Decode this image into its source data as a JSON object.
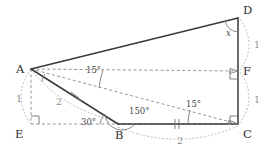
{
  "figure": {
    "background_color": "#ffffff",
    "solid_stroke_color": "#3a3a3a",
    "dashed_stroke_color": "#8a8a8a",
    "arc_stroke_color": "#a8a8a8"
  },
  "vertices": [
    {
      "id": "A",
      "label": "A",
      "x": 31,
      "y": 69,
      "label_x": 16,
      "label_y": 73
    },
    {
      "id": "B",
      "label": "B",
      "x": 118,
      "y": 124,
      "label_x": 115,
      "label_y": 139
    },
    {
      "id": "C",
      "label": "C",
      "x": 238,
      "y": 124,
      "label_x": 243,
      "label_y": 138
    },
    {
      "id": "D",
      "label": "D",
      "x": 238,
      "y": 18,
      "label_x": 243,
      "label_y": 14
    },
    {
      "id": "E",
      "label": "E",
      "x": 31,
      "y": 124,
      "label_x": 15,
      "label_y": 138
    },
    {
      "id": "F",
      "label": "F",
      "x": 238,
      "y": 71,
      "label_x": 243,
      "label_y": 75
    }
  ],
  "solid_edges": [
    {
      "name": "edge-A-D",
      "from": "A",
      "to": "D"
    },
    {
      "name": "edge-A-B",
      "from": "A",
      "to": "B"
    },
    {
      "name": "edge-B-C",
      "from": "B",
      "to": "C"
    },
    {
      "name": "edge-D-C",
      "from": "D",
      "to": "C"
    }
  ],
  "dashed_edges": [
    {
      "name": "edge-A-E",
      "from": "A",
      "to": "E"
    },
    {
      "name": "edge-E-C",
      "from": "E",
      "to": "C"
    },
    {
      "name": "edge-A-F",
      "from": "A",
      "to": "F"
    },
    {
      "name": "edge-A-C",
      "from": "A",
      "to": "C"
    }
  ],
  "angle_labels": [
    {
      "name": "angle-at-D",
      "text": "x",
      "x": 226,
      "y": 36,
      "italic": true
    },
    {
      "name": "angle-at-A-15",
      "text": "15°",
      "x": 86,
      "y": 73,
      "italic": false
    },
    {
      "name": "angle-at-C-15",
      "text": "15°",
      "x": 186,
      "y": 107,
      "italic": false
    },
    {
      "name": "angle-at-B-30",
      "text": "30°",
      "x": 81,
      "y": 125,
      "italic": false
    },
    {
      "name": "angle-at-B-150",
      "text": "150°",
      "x": 129,
      "y": 114,
      "italic": false
    }
  ],
  "length_labels": [
    {
      "name": "length-A-E",
      "text": "1",
      "x": 16,
      "y": 102
    },
    {
      "name": "length-A-B",
      "text": "2",
      "x": 56,
      "y": 105
    },
    {
      "name": "length-B-C",
      "text": "2",
      "x": 177,
      "y": 144
    },
    {
      "name": "length-D-F",
      "text": "1",
      "x": 254,
      "y": 48
    },
    {
      "name": "length-F-C",
      "text": "1",
      "x": 254,
      "y": 103
    }
  ],
  "right_angles": [
    {
      "name": "right-angle-at-E",
      "x": 31,
      "y": 124,
      "dx": 1,
      "dy": -1
    },
    {
      "name": "right-angle-at-F",
      "x": 238,
      "y": 71,
      "dx": -1,
      "dy": 1
    },
    {
      "name": "right-angle-at-C",
      "x": 238,
      "y": 124,
      "dx": -1,
      "dy": -1
    }
  ],
  "tick_marks": [
    {
      "name": "tick-on-A-B",
      "count": 1
    },
    {
      "name": "tick-on-B-C",
      "count": 2
    }
  ]
}
